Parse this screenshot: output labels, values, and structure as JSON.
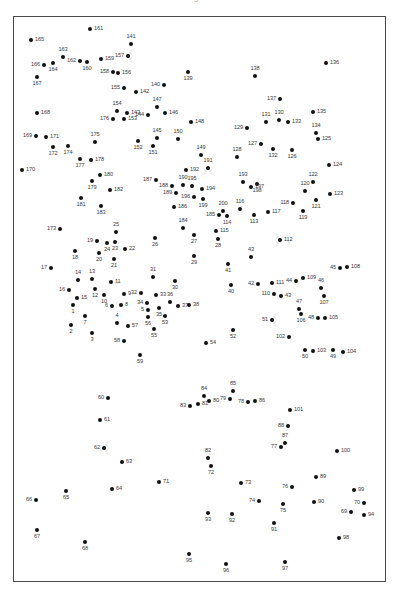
{
  "header": {
    "title": "Figure"
  },
  "figure": {
    "width": 398,
    "height": 604,
    "background": "#ffffff",
    "point_color": "#111111",
    "label_color": "#3a3a3a",
    "frame_color": "#4a4a4a",
    "point_count": 200
  },
  "plot_frame": {
    "left": 13,
    "top": 16,
    "width": 373,
    "height": 566
  },
  "chart_data": {
    "type": "scatter",
    "title": "",
    "xlabel": "",
    "ylabel": "",
    "grid": false,
    "legend": "none",
    "xlim": [
      13,
      386
    ],
    "ylim": [
      16,
      582
    ],
    "label_field": "id",
    "points": [
      {
        "id": "165",
        "x": 31,
        "y": 40,
        "lp": "r"
      },
      {
        "id": "161",
        "x": 90,
        "y": 29,
        "lp": "r"
      },
      {
        "id": "141",
        "x": 131,
        "y": 44,
        "lp": "t"
      },
      {
        "id": "163",
        "x": 63,
        "y": 57,
        "lp": "t"
      },
      {
        "id": "157",
        "x": 128,
        "y": 56,
        "lp": "l"
      },
      {
        "id": "159",
        "x": 101,
        "y": 59,
        "lp": "r"
      },
      {
        "id": "162",
        "x": 80,
        "y": 61,
        "lp": "l"
      },
      {
        "id": "160",
        "x": 87,
        "y": 62,
        "lp": "b"
      },
      {
        "id": "166",
        "x": 44,
        "y": 65,
        "lp": "l"
      },
      {
        "id": "164",
        "x": 53,
        "y": 63,
        "lp": "b"
      },
      {
        "id": "136",
        "x": 326,
        "y": 63,
        "lp": "r"
      },
      {
        "id": "158",
        "x": 113,
        "y": 72,
        "lp": "l"
      },
      {
        "id": "156",
        "x": 118,
        "y": 73,
        "lp": "r"
      },
      {
        "id": "167",
        "x": 37,
        "y": 77,
        "lp": "b"
      },
      {
        "id": "139",
        "x": 188,
        "y": 72,
        "lp": "b"
      },
      {
        "id": "138",
        "x": 255,
        "y": 76,
        "lp": "t"
      },
      {
        "id": "155",
        "x": 124,
        "y": 88,
        "lp": "l"
      },
      {
        "id": "142",
        "x": 136,
        "y": 92,
        "lp": "r"
      },
      {
        "id": "140",
        "x": 164,
        "y": 85,
        "lp": "l"
      },
      {
        "id": "137",
        "x": 280,
        "y": 99,
        "lp": "l"
      },
      {
        "id": "168",
        "x": 37,
        "y": 113,
        "lp": "r"
      },
      {
        "id": "154",
        "x": 117,
        "y": 111,
        "lp": "t"
      },
      {
        "id": "143",
        "x": 127,
        "y": 113,
        "lp": "r"
      },
      {
        "id": "147",
        "x": 157,
        "y": 107,
        "lp": "t"
      },
      {
        "id": "146",
        "x": 165,
        "y": 113,
        "lp": "r"
      },
      {
        "id": "144",
        "x": 148,
        "y": 115,
        "lp": "l"
      },
      {
        "id": "135",
        "x": 313,
        "y": 112,
        "lp": "r"
      },
      {
        "id": "176",
        "x": 113,
        "y": 119,
        "lp": "l"
      },
      {
        "id": "153",
        "x": 124,
        "y": 119,
        "lp": "r"
      },
      {
        "id": "148",
        "x": 191,
        "y": 122,
        "lp": "r"
      },
      {
        "id": "131",
        "x": 266,
        "y": 122,
        "lp": "t"
      },
      {
        "id": "130",
        "x": 279,
        "y": 120,
        "lp": "t"
      },
      {
        "id": "133",
        "x": 288,
        "y": 122,
        "lp": "r"
      },
      {
        "id": "129",
        "x": 247,
        "y": 128,
        "lp": "l"
      },
      {
        "id": "134",
        "x": 316,
        "y": 133,
        "lp": "t"
      },
      {
        "id": "125",
        "x": 318,
        "y": 139,
        "lp": "r"
      },
      {
        "id": "169",
        "x": 36,
        "y": 136,
        "lp": "l"
      },
      {
        "id": "171",
        "x": 46,
        "y": 137,
        "lp": "r"
      },
      {
        "id": "175",
        "x": 95,
        "y": 142,
        "lp": "t"
      },
      {
        "id": "152",
        "x": 138,
        "y": 141,
        "lp": "b"
      },
      {
        "id": "145",
        "x": 157,
        "y": 138,
        "lp": "t"
      },
      {
        "id": "150",
        "x": 178,
        "y": 139,
        "lp": "t"
      },
      {
        "id": "127",
        "x": 261,
        "y": 144,
        "lp": "l"
      },
      {
        "id": "132",
        "x": 273,
        "y": 149,
        "lp": "b"
      },
      {
        "id": "126",
        "x": 292,
        "y": 150,
        "lp": "b"
      },
      {
        "id": "172",
        "x": 53,
        "y": 147,
        "lp": "b"
      },
      {
        "id": "174",
        "x": 68,
        "y": 146,
        "lp": "b"
      },
      {
        "id": "151",
        "x": 153,
        "y": 146,
        "lp": "b"
      },
      {
        "id": "149",
        "x": 201,
        "y": 155,
        "lp": "t"
      },
      {
        "id": "128",
        "x": 237,
        "y": 157,
        "lp": "t"
      },
      {
        "id": "177",
        "x": 80,
        "y": 159,
        "lp": "b"
      },
      {
        "id": "178",
        "x": 91,
        "y": 160,
        "lp": "r"
      },
      {
        "id": "170",
        "x": 22,
        "y": 170,
        "lp": "r"
      },
      {
        "id": "124",
        "x": 329,
        "y": 165,
        "lp": "r"
      },
      {
        "id": "192",
        "x": 186,
        "y": 170,
        "lp": "r"
      },
      {
        "id": "191",
        "x": 208,
        "y": 168,
        "lp": "t"
      },
      {
        "id": "180",
        "x": 100,
        "y": 175,
        "lp": "r"
      },
      {
        "id": "179",
        "x": 92,
        "y": 181,
        "lp": "b"
      },
      {
        "id": "187",
        "x": 156,
        "y": 180,
        "lp": "l"
      },
      {
        "id": "193",
        "x": 243,
        "y": 182,
        "lp": "t"
      },
      {
        "id": "198",
        "x": 257,
        "y": 184,
        "lp": "b"
      },
      {
        "id": "122",
        "x": 313,
        "y": 182,
        "lp": "t"
      },
      {
        "id": "195",
        "x": 192,
        "y": 186,
        "lp": "t"
      },
      {
        "id": "197",
        "x": 251,
        "y": 187,
        "lp": "r"
      },
      {
        "id": "188",
        "x": 172,
        "y": 186,
        "lp": "l"
      },
      {
        "id": "190",
        "x": 183,
        "y": 185,
        "lp": "t"
      },
      {
        "id": "194",
        "x": 202,
        "y": 189,
        "lp": "r"
      },
      {
        "id": "182",
        "x": 110,
        "y": 190,
        "lp": "r"
      },
      {
        "id": "181",
        "x": 81,
        "y": 198,
        "lp": "b"
      },
      {
        "id": "189",
        "x": 176,
        "y": 193,
        "lp": "l"
      },
      {
        "id": "196",
        "x": 194,
        "y": 197,
        "lp": "l"
      },
      {
        "id": "199",
        "x": 203,
        "y": 199,
        "lp": "b"
      },
      {
        "id": "120",
        "x": 305,
        "y": 191,
        "lp": "t"
      },
      {
        "id": "123",
        "x": 330,
        "y": 194,
        "lp": "r"
      },
      {
        "id": "121",
        "x": 316,
        "y": 200,
        "lp": "b"
      },
      {
        "id": "118",
        "x": 293,
        "y": 203,
        "lp": "l"
      },
      {
        "id": "183",
        "x": 101,
        "y": 206,
        "lp": "b"
      },
      {
        "id": "186",
        "x": 174,
        "y": 207,
        "lp": "r"
      },
      {
        "id": "119",
        "x": 303,
        "y": 211,
        "lp": "b"
      },
      {
        "id": "200",
        "x": 223,
        "y": 211,
        "lp": "t"
      },
      {
        "id": "116",
        "x": 240,
        "y": 209,
        "lp": "t"
      },
      {
        "id": "117",
        "x": 268,
        "y": 212,
        "lp": "r"
      },
      {
        "id": "114",
        "x": 227,
        "y": 216,
        "lp": "b"
      },
      {
        "id": "113",
        "x": 254,
        "y": 215,
        "lp": "b"
      },
      {
        "id": "185",
        "x": 219,
        "y": 215,
        "lp": "l"
      },
      {
        "id": "173",
        "x": 60,
        "y": 229,
        "lp": "l"
      },
      {
        "id": "25",
        "x": 116,
        "y": 232,
        "lp": "t"
      },
      {
        "id": "184",
        "x": 183,
        "y": 228,
        "lp": "t"
      },
      {
        "id": "27",
        "x": 194,
        "y": 235,
        "lp": "b"
      },
      {
        "id": "115",
        "x": 216,
        "y": 231,
        "lp": "r"
      },
      {
        "id": "19",
        "x": 97,
        "y": 241,
        "lp": "l"
      },
      {
        "id": "23",
        "x": 115,
        "y": 242,
        "lp": "b"
      },
      {
        "id": "24",
        "x": 107,
        "y": 243,
        "lp": "b"
      },
      {
        "id": "26",
        "x": 155,
        "y": 238,
        "lp": "b"
      },
      {
        "id": "28",
        "x": 218,
        "y": 239,
        "lp": "b"
      },
      {
        "id": "112",
        "x": 280,
        "y": 240,
        "lp": "r"
      },
      {
        "id": "22",
        "x": 125,
        "y": 249,
        "lp": "r"
      },
      {
        "id": "18",
        "x": 75,
        "y": 251,
        "lp": "b"
      },
      {
        "id": "20",
        "x": 99,
        "y": 253,
        "lp": "b"
      },
      {
        "id": "29",
        "x": 194,
        "y": 256,
        "lp": "b"
      },
      {
        "id": "43",
        "x": 251,
        "y": 257,
        "lp": "t"
      },
      {
        "id": "21",
        "x": 114,
        "y": 259,
        "lp": "b"
      },
      {
        "id": "17",
        "x": 51,
        "y": 268,
        "lp": "l"
      },
      {
        "id": "41",
        "x": 228,
        "y": 264,
        "lp": "b"
      },
      {
        "id": "14",
        "x": 78,
        "y": 280,
        "lp": "t"
      },
      {
        "id": "13",
        "x": 92,
        "y": 279,
        "lp": "t"
      },
      {
        "id": "11",
        "x": 111,
        "y": 282,
        "lp": "r"
      },
      {
        "id": "31",
        "x": 153,
        "y": 277,
        "lp": "t"
      },
      {
        "id": "30",
        "x": 175,
        "y": 281,
        "lp": "b"
      },
      {
        "id": "45",
        "x": 340,
        "y": 268,
        "lp": "l"
      },
      {
        "id": "108",
        "x": 347,
        "y": 267,
        "lp": "r"
      },
      {
        "id": "109",
        "x": 303,
        "y": 278,
        "lp": "r"
      },
      {
        "id": "44",
        "x": 296,
        "y": 281,
        "lp": "l"
      },
      {
        "id": "111",
        "x": 272,
        "y": 283,
        "lp": "r"
      },
      {
        "id": "42",
        "x": 258,
        "y": 284,
        "lp": "l"
      },
      {
        "id": "16",
        "x": 69,
        "y": 290,
        "lp": "l"
      },
      {
        "id": "12",
        "x": 95,
        "y": 289,
        "lp": "b"
      },
      {
        "id": "40",
        "x": 231,
        "y": 285,
        "lp": "b"
      },
      {
        "id": "46",
        "x": 321,
        "y": 288,
        "lp": "t"
      },
      {
        "id": "15",
        "x": 77,
        "y": 298,
        "lp": "r"
      },
      {
        "id": "10",
        "x": 104,
        "y": 295,
        "lp": "b"
      },
      {
        "id": "9",
        "x": 124,
        "y": 294,
        "lp": "r"
      },
      {
        "id": "32",
        "x": 141,
        "y": 293,
        "lp": "l"
      },
      {
        "id": "33",
        "x": 156,
        "y": 295,
        "lp": "r"
      },
      {
        "id": "110",
        "x": 274,
        "y": 294,
        "lp": "l"
      },
      {
        "id": "43b",
        "x": 281,
        "y": 296,
        "lp": "r"
      },
      {
        "id": "107",
        "x": 324,
        "y": 296,
        "lp": "b"
      },
      {
        "id": "1",
        "x": 73,
        "y": 305,
        "lp": "b"
      },
      {
        "id": "6",
        "x": 112,
        "y": 306,
        "lp": "l"
      },
      {
        "id": "8",
        "x": 121,
        "y": 305,
        "lp": "r"
      },
      {
        "id": "34",
        "x": 147,
        "y": 303,
        "lp": "l"
      },
      {
        "id": "36",
        "x": 170,
        "y": 302,
        "lp": "t"
      },
      {
        "id": "37",
        "x": 178,
        "y": 306,
        "lp": "r"
      },
      {
        "id": "38",
        "x": 189,
        "y": 305,
        "lp": "r"
      },
      {
        "id": "5",
        "x": 148,
        "y": 310,
        "lp": "l"
      },
      {
        "id": "35",
        "x": 159,
        "y": 308,
        "lp": "b"
      },
      {
        "id": "47",
        "x": 299,
        "y": 309,
        "lp": "t"
      },
      {
        "id": "106",
        "x": 301,
        "y": 314,
        "lp": "b"
      },
      {
        "id": "7",
        "x": 85,
        "y": 316,
        "lp": "b"
      },
      {
        "id": "53",
        "x": 165,
        "y": 316,
        "lp": "b"
      },
      {
        "id": "56",
        "x": 148,
        "y": 317,
        "lp": "b"
      },
      {
        "id": "2",
        "x": 71,
        "y": 325,
        "lp": "b"
      },
      {
        "id": "4",
        "x": 117,
        "y": 323,
        "lp": "t"
      },
      {
        "id": "57",
        "x": 128,
        "y": 326,
        "lp": "r"
      },
      {
        "id": "51",
        "x": 272,
        "y": 320,
        "lp": "l"
      },
      {
        "id": "48",
        "x": 318,
        "y": 318,
        "lp": "l"
      },
      {
        "id": "105",
        "x": 325,
        "y": 318,
        "lp": "r"
      },
      {
        "id": "3",
        "x": 92,
        "y": 333,
        "lp": "b"
      },
      {
        "id": "55",
        "x": 154,
        "y": 329,
        "lp": "b"
      },
      {
        "id": "52",
        "x": 233,
        "y": 330,
        "lp": "b"
      },
      {
        "id": "102",
        "x": 289,
        "y": 337,
        "lp": "l"
      },
      {
        "id": "54",
        "x": 206,
        "y": 343,
        "lp": "r"
      },
      {
        "id": "58",
        "x": 124,
        "y": 341,
        "lp": "l"
      },
      {
        "id": "50",
        "x": 305,
        "y": 350,
        "lp": "b"
      },
      {
        "id": "103",
        "x": 313,
        "y": 351,
        "lp": "r"
      },
      {
        "id": "49",
        "x": 333,
        "y": 350,
        "lp": "b"
      },
      {
        "id": "104",
        "x": 343,
        "y": 352,
        "lp": "r"
      },
      {
        "id": "59",
        "x": 140,
        "y": 355,
        "lp": "b"
      },
      {
        "id": "60",
        "x": 108,
        "y": 398,
        "lp": "l"
      },
      {
        "id": "84",
        "x": 204,
        "y": 396,
        "lp": "t"
      },
      {
        "id": "85",
        "x": 233,
        "y": 391,
        "lp": "t"
      },
      {
        "id": "80",
        "x": 209,
        "y": 401,
        "lp": "r"
      },
      {
        "id": "79",
        "x": 230,
        "y": 399,
        "lp": "l"
      },
      {
        "id": "78",
        "x": 248,
        "y": 402,
        "lp": "l"
      },
      {
        "id": "86",
        "x": 255,
        "y": 401,
        "lp": "r"
      },
      {
        "id": "83",
        "x": 190,
        "y": 406,
        "lp": "l"
      },
      {
        "id": "81",
        "x": 198,
        "y": 404,
        "lp": "r"
      },
      {
        "id": "101",
        "x": 290,
        "y": 410,
        "lp": "r"
      },
      {
        "id": "61",
        "x": 100,
        "y": 420,
        "lp": "r"
      },
      {
        "id": "88",
        "x": 288,
        "y": 426,
        "lp": "l"
      },
      {
        "id": "87",
        "x": 285,
        "y": 443,
        "lp": "t"
      },
      {
        "id": "77",
        "x": 281,
        "y": 447,
        "lp": "l"
      },
      {
        "id": "62",
        "x": 104,
        "y": 448,
        "lp": "l"
      },
      {
        "id": "100",
        "x": 337,
        "y": 451,
        "lp": "r"
      },
      {
        "id": "63",
        "x": 122,
        "y": 462,
        "lp": "r"
      },
      {
        "id": "82",
        "x": 208,
        "y": 458,
        "lp": "t"
      },
      {
        "id": "72",
        "x": 211,
        "y": 466,
        "lp": "b"
      },
      {
        "id": "89",
        "x": 316,
        "y": 477,
        "lp": "r"
      },
      {
        "id": "71",
        "x": 159,
        "y": 482,
        "lp": "r"
      },
      {
        "id": "73",
        "x": 241,
        "y": 483,
        "lp": "r"
      },
      {
        "id": "76",
        "x": 292,
        "y": 487,
        "lp": "l"
      },
      {
        "id": "99",
        "x": 354,
        "y": 490,
        "lp": "r"
      },
      {
        "id": "64",
        "x": 112,
        "y": 489,
        "lp": "r"
      },
      {
        "id": "65",
        "x": 66,
        "y": 491,
        "lp": "b"
      },
      {
        "id": "70",
        "x": 364,
        "y": 503,
        "lp": "l"
      },
      {
        "id": "66",
        "x": 36,
        "y": 500,
        "lp": "l"
      },
      {
        "id": "74",
        "x": 259,
        "y": 501,
        "lp": "l"
      },
      {
        "id": "75",
        "x": 283,
        "y": 504,
        "lp": "b"
      },
      {
        "id": "90",
        "x": 314,
        "y": 502,
        "lp": "r"
      },
      {
        "id": "69",
        "x": 351,
        "y": 512,
        "lp": "l"
      },
      {
        "id": "94",
        "x": 364,
        "y": 515,
        "lp": "r"
      },
      {
        "id": "93",
        "x": 208,
        "y": 513,
        "lp": "b"
      },
      {
        "id": "92",
        "x": 232,
        "y": 514,
        "lp": "b"
      },
      {
        "id": "67",
        "x": 37,
        "y": 530,
        "lp": "b"
      },
      {
        "id": "91",
        "x": 274,
        "y": 523,
        "lp": "b"
      },
      {
        "id": "98",
        "x": 339,
        "y": 538,
        "lp": "r"
      },
      {
        "id": "68",
        "x": 85,
        "y": 542,
        "lp": "b"
      },
      {
        "id": "95",
        "x": 189,
        "y": 554,
        "lp": "b"
      },
      {
        "id": "96",
        "x": 226,
        "y": 564,
        "lp": "b"
      },
      {
        "id": "97",
        "x": 285,
        "y": 562,
        "lp": "b"
      }
    ]
  }
}
